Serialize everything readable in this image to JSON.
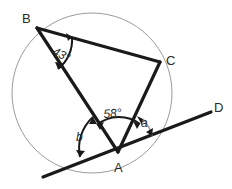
{
  "figure": {
    "type": "circle-geometry-diagram",
    "background_color": "#ffffff",
    "stroke_color": "#1a1a1a",
    "circle_color": "#8c8c8c",
    "vertices": [
      {
        "id": "B",
        "label": "B",
        "label_x": 22,
        "label_y": 12,
        "point_x": 37,
        "point_y": 28
      },
      {
        "id": "C",
        "label": "C",
        "label_x": 166,
        "label_y": 54,
        "point_x": 160,
        "point_y": 62
      },
      {
        "id": "A",
        "label": "A",
        "label_x": 114,
        "label_y": 161,
        "point_x": 118,
        "point_y": 152
      },
      {
        "id": "D",
        "label": "D",
        "label_x": 214,
        "label_y": 101,
        "point_x": 210,
        "point_y": 112
      }
    ],
    "angles": [
      {
        "id": "angle-B",
        "label": "43",
        "unit": "°",
        "value": 43,
        "at_vertex": "B",
        "label_x": 56,
        "label_y": 45
      },
      {
        "id": "angle-BAC",
        "label": "58",
        "unit": "°",
        "value": 58,
        "at_vertex": "A",
        "label_x": 103,
        "label_y": 108
      },
      {
        "id": "angle-a",
        "label": "a",
        "unit": "",
        "value": null,
        "at_vertex": "A",
        "label_x": 141,
        "label_y": 117
      },
      {
        "id": "angle-b",
        "label": "b",
        "unit": "",
        "value": null,
        "at_vertex": "A",
        "label_x": 76,
        "label_y": 131
      }
    ],
    "circle": {
      "cx": 92,
      "cy": 93,
      "r": 80
    },
    "segments": [
      {
        "id": "segment-BC",
        "from": "B",
        "to": "C"
      },
      {
        "id": "segment-BA",
        "from": "B",
        "to": "A"
      },
      {
        "id": "segment-CA",
        "from": "C",
        "to": "A"
      },
      {
        "id": "tangent-line",
        "from": "tangent-left-end",
        "to": "D"
      }
    ]
  }
}
